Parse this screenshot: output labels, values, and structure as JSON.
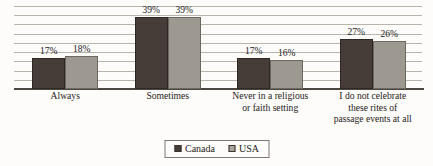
{
  "chart_data": {
    "type": "bar",
    "title": "",
    "subtitle": "",
    "xlabel": "",
    "ylabel": "",
    "ylim": [
      0,
      45
    ],
    "grid": true,
    "gridline_values": [
      0,
      5,
      10,
      15,
      20,
      25,
      30,
      35,
      40,
      45
    ],
    "legend_position": "bottom",
    "value_suffix": "%",
    "categories": [
      "Always",
      "Sometimes",
      "Never in a religious\nor faith setting",
      "I do not celebrate\nthese rites of\npassage events at all"
    ],
    "category_lines": [
      [
        "Always"
      ],
      [
        "Sometimes"
      ],
      [
        "Never in a religious",
        "or faith setting"
      ],
      [
        "I do not celebrate",
        "these rites of",
        "passage events at all"
      ]
    ],
    "series": [
      {
        "name": "Canada",
        "color": "#463c38",
        "values": [
          17,
          39,
          17,
          27
        ],
        "labels": [
          "17%",
          "39%",
          "17%",
          "27%"
        ]
      },
      {
        "name": "USA",
        "color": "#9d9890",
        "values": [
          18,
          39,
          16,
          26
        ],
        "labels": [
          "18%",
          "39%",
          "16%",
          "26%"
        ]
      }
    ]
  },
  "legend": {
    "entries": [
      {
        "label": "Canada",
        "swatch": "canada"
      },
      {
        "label": "USA",
        "swatch": "usa"
      }
    ]
  }
}
